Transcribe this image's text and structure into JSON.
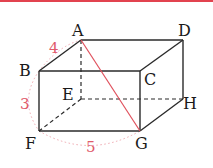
{
  "figure": {
    "type": "rectangular-prism",
    "colors": {
      "edge": "#2a2a2a",
      "diagonal": "#e0505c",
      "measure": "#e05a6a",
      "top_bar": "#e2434f"
    },
    "vertices": {
      "A": "A",
      "B": "B",
      "C": "C",
      "D": "D",
      "E": "E",
      "F": "F",
      "G": "G",
      "H": "H"
    },
    "measurements": {
      "AB": "4",
      "BF": "3",
      "FG": "5"
    },
    "highlighted_segment": "AG",
    "hidden_edges": [
      "AE",
      "EF",
      "EH"
    ]
  }
}
